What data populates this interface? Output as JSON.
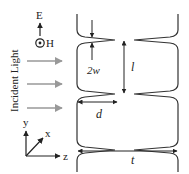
{
  "diagram": {
    "type": "slit-array-cross-section",
    "field_labels": {
      "electric": "E",
      "magnetic": "H"
    },
    "incident_label": "Incident Light",
    "incident_arrow_count": 3,
    "dimension_labels": {
      "gap": "2w",
      "length": "l",
      "depth": "d",
      "thickness": "t"
    },
    "axes": {
      "y": "y",
      "x": "x",
      "z": "z"
    },
    "colors": {
      "line": "#333333",
      "light_arrow": "#999999",
      "text": "#222222"
    }
  }
}
